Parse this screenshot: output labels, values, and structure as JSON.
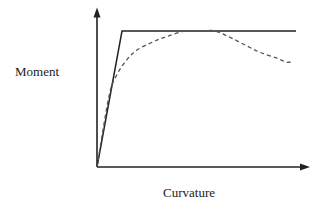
{
  "chart_data": {
    "type": "line",
    "title": "",
    "xlabel": "Curvature",
    "ylabel": "Moment",
    "xlim": [
      0,
      105
    ],
    "ylim": [
      0,
      115
    ],
    "grid": false,
    "ticks": false,
    "legend": null,
    "axes": {
      "arrows": true
    },
    "series": [
      {
        "name": "idealized-elastic-perfectly-plastic",
        "style": "solid",
        "color": "#222222",
        "x": [
          0,
          12.5,
          99.5
        ],
        "y": [
          0,
          100,
          100
        ]
      },
      {
        "name": "actual-response",
        "style": "dashed",
        "color": "#555555",
        "x": [
          0,
          6,
          10,
          15,
          20,
          28,
          35,
          44,
          52,
          59,
          67,
          75,
          82,
          90,
          95,
          98
        ],
        "y": [
          0,
          52,
          68,
          79,
          86,
          92,
          96,
          100,
          100,
          100,
          95,
          89,
          84,
          80,
          77,
          78
        ]
      }
    ]
  },
  "labels": {
    "y_axis": "Moment",
    "x_axis": "Curvature"
  },
  "style": {
    "axis_color": "#222222",
    "solid_line_color": "#222222",
    "dashed_line_color": "#555555"
  }
}
